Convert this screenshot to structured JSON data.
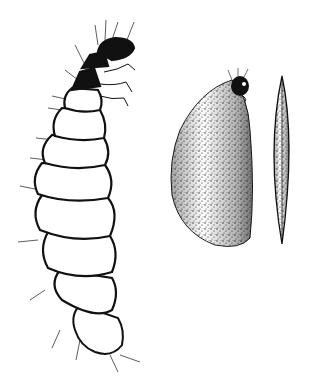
{
  "image": {
    "width": 315,
    "height": 377,
    "background": "#ffffff",
    "ink_color": "#111111",
    "subjects": [
      {
        "name": "larva",
        "description": "segmented hairy larva with dark banded head and thorax, curving upward"
      },
      {
        "name": "case-broad",
        "description": "stippled flattened larval case with larva head protruding at top"
      },
      {
        "name": "case-side",
        "description": "stippled spindle-shaped case viewed edge-on"
      }
    ]
  }
}
